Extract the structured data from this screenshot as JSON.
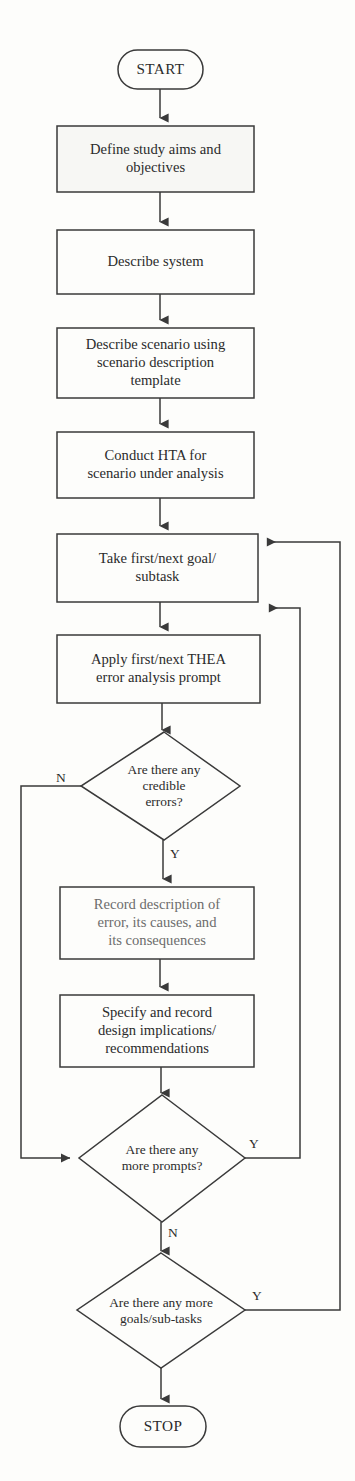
{
  "diagram": {
    "type": "flowchart",
    "stroke_color": "#3a3a3a",
    "text_color": "#2b2b2b",
    "background_color": "#fdfdfb",
    "terminators": [
      {
        "id": "start",
        "label": "START",
        "shape": "stadium"
      },
      {
        "id": "stop",
        "label": "STOP",
        "shape": "stadium"
      }
    ],
    "process_boxes": [
      {
        "id": "p1",
        "label": "Define study aims and\nobjectives"
      },
      {
        "id": "p2",
        "label": "Describe system"
      },
      {
        "id": "p3",
        "label": "Describe scenario using\nscenario description\ntemplate"
      },
      {
        "id": "p4",
        "label": "Conduct HTA for\nscenario under analysis"
      },
      {
        "id": "p5",
        "label": "Take first/next goal/\nsubtask"
      },
      {
        "id": "p6",
        "label": "Apply first/next THEA\nerror analysis prompt"
      },
      {
        "id": "p7",
        "label": "Record description of\nerror, its causes, and\nits consequences"
      },
      {
        "id": "p8",
        "label": "Specify and record\ndesign implications/\nrecommendations"
      }
    ],
    "decisions": [
      {
        "id": "d1",
        "label": "Are there any\ncredible\nerrors?",
        "yes_label": "Y",
        "no_label": "N"
      },
      {
        "id": "d2",
        "label": "Are there any\nmore prompts?",
        "yes_label": "Y",
        "no_label": "N"
      },
      {
        "id": "d3",
        "label": "Are there any more\ngoals/sub-tasks",
        "yes_label": "Y",
        "no_label": ""
      }
    ],
    "edge_labels": [
      {
        "id": "d1-no",
        "text": "N"
      },
      {
        "id": "d1-yes",
        "text": "Y"
      },
      {
        "id": "d2-yes",
        "text": "Y"
      },
      {
        "id": "d2-no",
        "text": "N"
      },
      {
        "id": "d3-yes",
        "text": "Y"
      }
    ],
    "flow_sequence": [
      "START",
      "Define study aims and objectives",
      "Describe system",
      "Describe scenario using scenario description template",
      "Conduct HTA for scenario under analysis",
      "Take first/next goal/subtask",
      "Apply first/next THEA error analysis prompt",
      "Are there any credible errors?",
      "Record description of error, its causes, and its consequences",
      "Specify and record design implications/recommendations",
      "Are there any more prompts?",
      "Are there any more goals/sub-tasks",
      "STOP"
    ]
  }
}
